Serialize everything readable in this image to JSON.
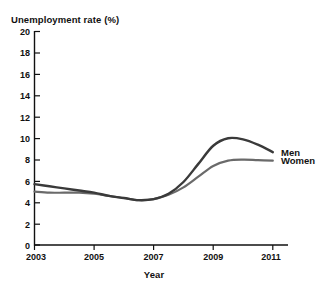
{
  "chart_data": {
    "type": "line",
    "title": "",
    "xlabel": "Year",
    "ylabel": "Unemployment rate (%)",
    "xlim": [
      2003,
      2011
    ],
    "ylim": [
      0,
      20
    ],
    "grid": false,
    "legend_position": "right-of-line-ends",
    "xticks": [
      "2003",
      "2005",
      "2007",
      "2009",
      "2011"
    ],
    "xtick_values": [
      2003,
      2005,
      2007,
      2009,
      2011
    ],
    "yticks": [
      "0",
      "2",
      "4",
      "6",
      "8",
      "10",
      "12",
      "14",
      "16",
      "18",
      "20"
    ],
    "ytick_values": [
      0,
      2,
      4,
      6,
      8,
      10,
      12,
      14,
      16,
      18,
      20
    ],
    "x": [
      2003,
      2003.5,
      2004,
      2004.5,
      2005,
      2005.5,
      2006,
      2006.5,
      2007,
      2007.5,
      2008,
      2008.5,
      2009,
      2009.5,
      2010,
      2010.5,
      2011
    ],
    "series": [
      {
        "name": "Men",
        "color": "#3a3a3a",
        "values": [
          5.7,
          5.5,
          5.3,
          5.1,
          4.9,
          4.6,
          4.4,
          4.2,
          4.3,
          4.8,
          5.9,
          7.6,
          9.3,
          10.0,
          9.9,
          9.4,
          8.7
        ]
      },
      {
        "name": "Women",
        "color": "#6a6a6a",
        "values": [
          5.0,
          4.9,
          4.9,
          4.9,
          4.8,
          4.6,
          4.4,
          4.2,
          4.3,
          4.7,
          5.4,
          6.4,
          7.4,
          7.9,
          8.0,
          7.95,
          7.9
        ]
      }
    ],
    "annotations": [
      {
        "text": "Men",
        "at_x": 2011,
        "at_y": 8.7
      },
      {
        "text": "Women",
        "at_y": 7.9,
        "at_x": 2011
      }
    ]
  },
  "axis": {
    "axis_color": "#111111",
    "y_title": "Unemployment rate (%)",
    "x_title": "Year"
  },
  "labels": {
    "men": "Men",
    "women": "Women"
  },
  "ticks": {
    "y": {
      "t20": "20",
      "t18": "18",
      "t16": "16",
      "t14": "14",
      "t12": "12",
      "t10": "10",
      "t8": "8",
      "t6": "6",
      "t4": "4",
      "t2": "2",
      "t0": "0"
    },
    "x": {
      "x2003": "2003",
      "x2005": "2005",
      "x2007": "2007",
      "x2009": "2009",
      "x2011": "2011"
    }
  }
}
